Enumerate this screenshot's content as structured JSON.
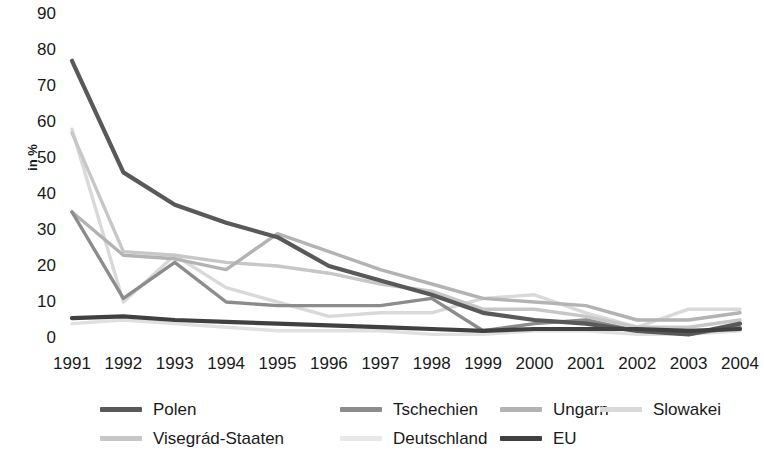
{
  "chart_data": {
    "type": "line",
    "title": "",
    "xlabel": "",
    "ylabel": "in %",
    "categories": [
      "1991",
      "1992",
      "1993",
      "1994",
      "1995",
      "1996",
      "1997",
      "1998",
      "1999",
      "2000",
      "2001",
      "2002",
      "2003",
      "2004"
    ],
    "ylim": [
      0,
      90
    ],
    "yticks": [
      0,
      10,
      20,
      30,
      40,
      50,
      60,
      70,
      80,
      90
    ],
    "grid": false,
    "legend_position": "bottom",
    "series": [
      {
        "name": "Polen",
        "color": "#595959",
        "values": [
          77,
          46,
          37,
          32,
          28,
          20,
          16,
          12,
          7,
          5,
          4,
          2,
          1,
          4
        ]
      },
      {
        "name": "Tschechien",
        "color": "#8c8c8c",
        "values": [
          35,
          11,
          21,
          10,
          9,
          9,
          9,
          11,
          2,
          4,
          5,
          2,
          1,
          3
        ]
      },
      {
        "name": "Ungarn",
        "color": "#b3b3b3",
        "values": [
          35,
          23,
          22,
          19,
          29,
          24,
          19,
          15,
          11,
          10,
          9,
          5,
          5,
          7
        ]
      },
      {
        "name": "Slowakei",
        "color": "#d9d9d9",
        "values": [
          58,
          10,
          23,
          14,
          10,
          6,
          7,
          7,
          11,
          12,
          7,
          3,
          8,
          8
        ]
      },
      {
        "name": "Visegrád-Staaten",
        "color": "#c7c7c7",
        "values": [
          57,
          24,
          23,
          21,
          20,
          18,
          15,
          13,
          8,
          8,
          6,
          3,
          3,
          5
        ]
      },
      {
        "name": "Deutschland",
        "color": "#e0e0e0",
        "values": [
          4,
          5,
          4,
          3,
          2,
          2,
          2,
          1,
          1,
          2,
          2,
          1,
          1,
          2
        ]
      },
      {
        "name": "EU",
        "color": "#404040",
        "values": [
          5.5,
          6,
          5,
          4.5,
          4,
          3.5,
          3,
          2.5,
          2,
          2.5,
          2.5,
          2.5,
          2,
          2.5
        ]
      }
    ]
  },
  "legend": {
    "items": [
      {
        "label": "Polen",
        "color": "#595959"
      },
      {
        "label": "Tschechien",
        "color": "#8c8c8c"
      },
      {
        "label": "Ungarn",
        "color": "#b3b3b3"
      },
      {
        "label": "Slowakei",
        "color": "#d9d9d9"
      },
      {
        "label": "Visegrád-Staaten",
        "color": "#c7c7c7"
      },
      {
        "label": "Deutschland",
        "color": "#e8e8e8"
      },
      {
        "label": "EU",
        "color": "#404040"
      }
    ]
  }
}
